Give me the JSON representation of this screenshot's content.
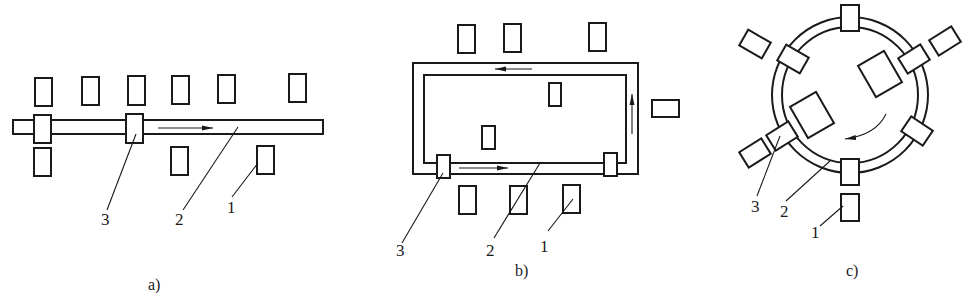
{
  "figure": {
    "panels": [
      {
        "id": "a",
        "caption": "a)",
        "layout": "linear track",
        "callouts": [
          {
            "number": "1",
            "meaning": "machine/workstation"
          },
          {
            "number": "2",
            "meaning": "track"
          },
          {
            "number": "3",
            "meaning": "carrier/vehicle"
          }
        ],
        "flow_direction": "left-to-right"
      },
      {
        "id": "b",
        "caption": "b)",
        "layout": "rectangular loop track",
        "callouts": [
          {
            "number": "1",
            "meaning": "machine/workstation"
          },
          {
            "number": "2",
            "meaning": "track"
          },
          {
            "number": "3",
            "meaning": "carrier/vehicle"
          }
        ],
        "flow_direction": "counter-clockwise"
      },
      {
        "id": "c",
        "caption": "c)",
        "layout": "circular loop track",
        "callouts": [
          {
            "number": "1",
            "meaning": "machine/workstation"
          },
          {
            "number": "2",
            "meaning": "track"
          },
          {
            "number": "3",
            "meaning": "carrier/vehicle"
          }
        ],
        "flow_direction": "clockwise"
      }
    ]
  },
  "labels": {
    "a": {
      "n1": "1",
      "n2": "2",
      "n3": "3",
      "caption": "a)"
    },
    "b": {
      "n1": "1",
      "n2": "2",
      "n3": "3",
      "caption": "b)"
    },
    "c": {
      "n1": "1",
      "n2": "2",
      "n3": "3",
      "caption": "c)"
    }
  }
}
